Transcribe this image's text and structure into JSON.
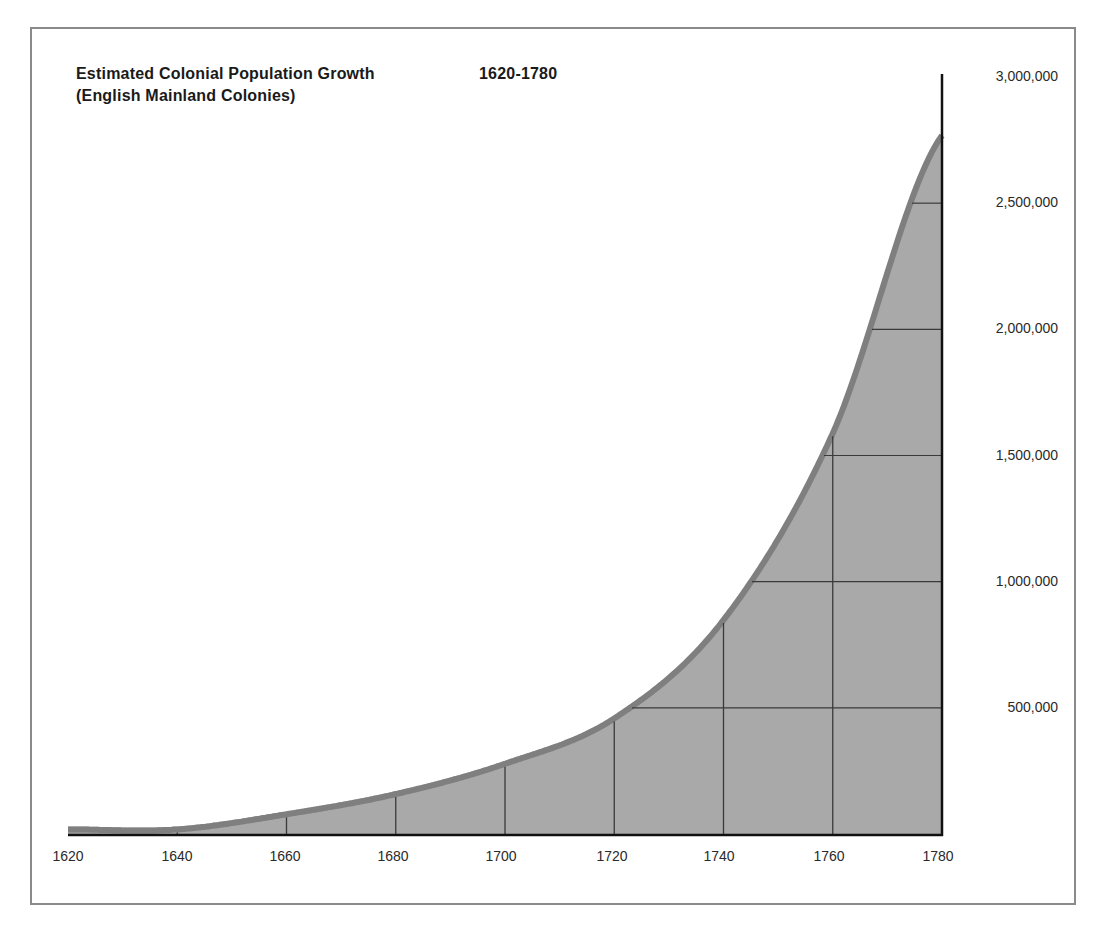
{
  "chart_data": {
    "type": "area",
    "title": "Estimated Colonial Population Growth",
    "title_range": "1620-1780",
    "subtitle": "(English Mainland Colonies)",
    "xlabel": "",
    "ylabel": "",
    "x": [
      1620,
      1640,
      1660,
      1680,
      1700,
      1720,
      1740,
      1760,
      1780
    ],
    "values": [
      30000,
      30000,
      90000,
      170000,
      290000,
      470000,
      860000,
      1600000,
      2780000
    ],
    "x_tick_labels": [
      "1620",
      "1640",
      "1660",
      "1680",
      "1700",
      "1720",
      "1740",
      "1760",
      "1780"
    ],
    "y_tick_labels": [
      "500,000",
      "1,000,000",
      "1,500,000",
      "2,000,000",
      "2,500,000",
      "3,000,000"
    ],
    "y_ticks": [
      500000,
      1000000,
      1500000,
      2000000,
      2500000,
      3000000
    ],
    "ylim": [
      0,
      3000000
    ],
    "xlim": [
      1620,
      1780
    ],
    "grid": true,
    "legend": "none",
    "y_axis_position": "right",
    "colors": {
      "fill": "#a9a9a9",
      "edge": "#7f7f7f",
      "grid": "#3a3a3a",
      "axis": "#111111",
      "frame": "#8a8a8a"
    }
  }
}
